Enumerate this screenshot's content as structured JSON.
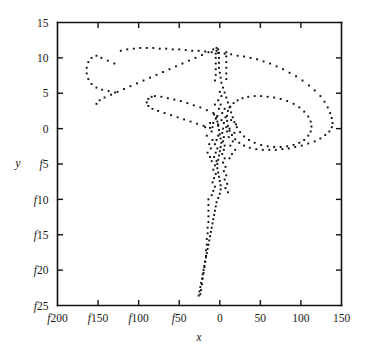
{
  "figure": {
    "background_color": "#ffffff",
    "ink_color": "#111111",
    "negative_sign_glyph": "f",
    "note": "Negative axis numbers are rendered with an italic 'f' in place of the minus sign (font encoding artifact)."
  },
  "chart_data": {
    "type": "scatter",
    "title": "",
    "subtitle": "",
    "xlabel": "x",
    "ylabel": "y",
    "legend": [],
    "legend_position": "none",
    "grid": false,
    "marker": "small filled square, dotted trajectory",
    "marker_color": "#0d0d0d",
    "xlim": [
      -200,
      150
    ],
    "ylim": [
      -25,
      15
    ],
    "xticks": [
      -200,
      -150,
      -100,
      -50,
      0,
      50,
      100,
      150
    ],
    "yticks": [
      15,
      10,
      5,
      0,
      -5,
      -10,
      -15,
      -20,
      -25
    ],
    "xtick_labels": [
      "f200",
      "f150",
      "f100",
      "f50",
      "0",
      "50",
      "100",
      "150"
    ],
    "ytick_labels": [
      "15",
      "10",
      "5",
      "0",
      "f5",
      "f10",
      "f15",
      "f20",
      "f25"
    ],
    "series": [
      {
        "name": "trajectory",
        "points": [
          [
            -122,
            11.0
          ],
          [
            -114,
            11.2
          ],
          [
            -106,
            11.3
          ],
          [
            -98,
            11.4
          ],
          [
            -90,
            11.4
          ],
          [
            -82,
            11.4
          ],
          [
            -74,
            11.3
          ],
          [
            -66,
            11.3
          ],
          [
            -58,
            11.2
          ],
          [
            -50,
            11.2
          ],
          [
            -42,
            11.1
          ],
          [
            -34,
            11.0
          ],
          [
            -26,
            11.0
          ],
          [
            -18,
            10.9
          ],
          [
            -10,
            10.8
          ],
          [
            -2,
            10.7
          ],
          [
            6,
            10.6
          ],
          [
            14,
            10.5
          ],
          [
            22,
            10.3
          ],
          [
            30,
            10.2
          ],
          [
            38,
            10.0
          ],
          [
            46,
            9.8
          ],
          [
            54,
            9.5
          ],
          [
            62,
            9.2
          ],
          [
            70,
            8.8
          ],
          [
            78,
            8.4
          ],
          [
            86,
            7.9
          ],
          [
            94,
            7.4
          ],
          [
            102,
            6.8
          ],
          [
            110,
            6.1
          ],
          [
            117,
            5.4
          ],
          [
            124,
            4.6
          ],
          [
            129,
            3.8
          ],
          [
            133,
            3.0
          ],
          [
            136,
            2.2
          ],
          [
            138,
            1.5
          ],
          [
            139,
            0.8
          ],
          [
            138,
            0.2
          ],
          [
            135,
            -0.4
          ],
          [
            130,
            -0.9
          ],
          [
            124,
            -1.4
          ],
          [
            117,
            -1.8
          ],
          [
            109,
            -2.1
          ],
          [
            101,
            -2.4
          ],
          [
            93,
            -2.6
          ],
          [
            85,
            -2.8
          ],
          [
            77,
            -2.9
          ],
          [
            69,
            -3.0
          ],
          [
            61,
            -3.0
          ],
          [
            53,
            -3.0
          ],
          [
            45,
            -2.9
          ],
          [
            37,
            -2.7
          ],
          [
            30,
            -2.4
          ],
          [
            24,
            -2.0
          ],
          [
            19,
            -1.5
          ],
          [
            15,
            -0.9
          ],
          [
            12,
            -0.3
          ],
          [
            10,
            0.4
          ],
          [
            9,
            1.1
          ],
          [
            9,
            1.8
          ],
          [
            10,
            2.5
          ],
          [
            13,
            3.1
          ],
          [
            17,
            3.6
          ],
          [
            22,
            4.0
          ],
          [
            28,
            4.3
          ],
          [
            35,
            4.5
          ],
          [
            43,
            4.6
          ],
          [
            51,
            4.6
          ],
          [
            59,
            4.5
          ],
          [
            67,
            4.4
          ],
          [
            75,
            4.2
          ],
          [
            83,
            3.9
          ],
          [
            91,
            3.5
          ],
          [
            98,
            3.0
          ],
          [
            104,
            2.4
          ],
          [
            109,
            1.7
          ],
          [
            112,
            1.0
          ],
          [
            113,
            0.3
          ],
          [
            112,
            -0.4
          ],
          [
            109,
            -1.0
          ],
          [
            104,
            -1.6
          ],
          [
            98,
            -2.0
          ],
          [
            91,
            -2.3
          ],
          [
            83,
            -2.5
          ],
          [
            75,
            -2.6
          ],
          [
            67,
            -2.6
          ],
          [
            59,
            -2.5
          ],
          [
            51,
            -2.3
          ],
          [
            43,
            -2.0
          ],
          [
            36,
            -1.6
          ],
          [
            30,
            -1.1
          ],
          [
            25,
            -0.5
          ],
          [
            21,
            0.2
          ],
          [
            18,
            0.9
          ],
          [
            16,
            1.6
          ],
          [
            14,
            2.3
          ],
          [
            12,
            3.0
          ],
          [
            10,
            3.7
          ],
          [
            8,
            4.4
          ],
          [
            6,
            5.1
          ],
          [
            4,
            5.8
          ],
          [
            2,
            6.5
          ],
          [
            1,
            7.2
          ],
          [
            0,
            7.9
          ],
          [
            -1,
            8.6
          ],
          [
            -1,
            9.3
          ],
          [
            -1,
            10.0
          ],
          [
            -1,
            10.7
          ],
          [
            -2,
            11.2
          ],
          [
            -4,
            11.4
          ],
          [
            -8,
            11.2
          ],
          [
            -14,
            10.8
          ],
          [
            -22,
            10.4
          ],
          [
            -30,
            10.0
          ],
          [
            -38,
            9.6
          ],
          [
            -46,
            9.2
          ],
          [
            -54,
            8.8
          ],
          [
            -62,
            8.4
          ],
          [
            -70,
            8.0
          ],
          [
            -78,
            7.6
          ],
          [
            -86,
            7.2
          ],
          [
            -94,
            6.8
          ],
          [
            -102,
            6.4
          ],
          [
            -110,
            6.0
          ],
          [
            -118,
            5.6
          ],
          [
            -126,
            5.2
          ],
          [
            -134,
            4.8
          ],
          [
            -142,
            4.4
          ],
          [
            -148,
            4.0
          ],
          [
            -152,
            3.5
          ],
          [
            -130,
            9.2
          ],
          [
            -138,
            9.6
          ],
          [
            -146,
            10.0
          ],
          [
            -152,
            10.3
          ],
          [
            -158,
            10.0
          ],
          [
            -162,
            9.4
          ],
          [
            -164,
            8.6
          ],
          [
            -164,
            7.8
          ],
          [
            -162,
            7.0
          ],
          [
            -158,
            6.3
          ],
          [
            -152,
            5.8
          ],
          [
            -145,
            5.5
          ],
          [
            -137,
            5.3
          ],
          [
            -129,
            5.1
          ],
          [
            -80,
            4.6
          ],
          [
            -72,
            4.5
          ],
          [
            -64,
            4.3
          ],
          [
            -56,
            4.1
          ],
          [
            -48,
            3.9
          ],
          [
            -40,
            3.6
          ],
          [
            -32,
            3.3
          ],
          [
            -24,
            3.0
          ],
          [
            -16,
            2.6
          ],
          [
            -8,
            2.2
          ],
          [
            -84,
            4.5
          ],
          [
            -88,
            4.2
          ],
          [
            -90,
            3.7
          ],
          [
            -88,
            3.2
          ],
          [
            -83,
            2.8
          ],
          [
            -76,
            2.5
          ],
          [
            -68,
            2.2
          ],
          [
            -60,
            1.9
          ],
          [
            -52,
            1.6
          ],
          [
            -44,
            1.3
          ],
          [
            -36,
            1.0
          ],
          [
            -28,
            0.7
          ],
          [
            -20,
            0.4
          ],
          [
            -12,
            0.1
          ],
          [
            -6,
            6.8
          ],
          [
            -5,
            7.6
          ],
          [
            -5,
            8.4
          ],
          [
            -5,
            9.2
          ],
          [
            -5,
            10.0
          ],
          [
            -5,
            10.6
          ],
          [
            -4,
            11.0
          ],
          [
            8,
            7.0
          ],
          [
            8,
            7.8
          ],
          [
            8,
            8.6
          ],
          [
            8,
            9.4
          ],
          [
            8,
            10.2
          ],
          [
            8,
            10.8
          ],
          [
            -4,
            1.6
          ],
          [
            -3,
            1.0
          ],
          [
            -2,
            0.4
          ],
          [
            -1,
            -0.2
          ],
          [
            0,
            -0.8
          ],
          [
            1,
            -1.4
          ],
          [
            2,
            -2.0
          ],
          [
            1,
            -2.6
          ],
          [
            0,
            -3.2
          ],
          [
            -1,
            -3.8
          ],
          [
            -2,
            -4.4
          ],
          [
            -3,
            -5.0
          ],
          [
            -3,
            -5.6
          ],
          [
            -2,
            -6.2
          ],
          [
            -1,
            -6.8
          ],
          [
            0,
            -7.4
          ],
          [
            1,
            -8.0
          ],
          [
            1,
            -8.6
          ],
          [
            0,
            -9.2
          ],
          [
            -2,
            -9.8
          ],
          [
            -4,
            -10.4
          ],
          [
            -5,
            -11.0
          ],
          [
            -6,
            -11.6
          ],
          [
            -7,
            -12.2
          ],
          [
            -8,
            -12.8
          ],
          [
            -9,
            -13.4
          ],
          [
            -10,
            -14.0
          ],
          [
            -11,
            -14.6
          ],
          [
            -12,
            -15.2
          ],
          [
            -13,
            -15.8
          ],
          [
            -14,
            -16.4
          ],
          [
            -15,
            -17.0
          ],
          [
            -16,
            -17.6
          ],
          [
            -17,
            -18.2
          ],
          [
            -18,
            -18.8
          ],
          [
            -19,
            -19.4
          ],
          [
            -20,
            -20.0
          ],
          [
            -21,
            -20.6
          ],
          [
            -22,
            -21.2
          ],
          [
            -23,
            -21.8
          ],
          [
            -24,
            -22.4
          ],
          [
            -25,
            -23.0
          ],
          [
            -26,
            -23.6
          ],
          [
            -14,
            -10.0
          ],
          [
            -14,
            -10.8
          ],
          [
            -14,
            -11.6
          ],
          [
            -14,
            -12.4
          ],
          [
            -14,
            -13.2
          ],
          [
            -15,
            -14.0
          ],
          [
            -15,
            -14.8
          ],
          [
            -16,
            -15.6
          ],
          [
            -16,
            -16.4
          ],
          [
            -17,
            -17.2
          ],
          [
            -17,
            -18.0
          ],
          [
            -18,
            -18.8
          ],
          [
            -19,
            -19.6
          ],
          [
            -20,
            -20.4
          ],
          [
            -21,
            -21.2
          ],
          [
            -22,
            -22.0
          ],
          [
            -23,
            -22.8
          ],
          [
            -24,
            -23.4
          ],
          [
            -2,
            -1.0
          ],
          [
            -4,
            -1.6
          ],
          [
            -6,
            -2.2
          ],
          [
            -3,
            -2.8
          ],
          [
            -5,
            -3.4
          ],
          [
            -7,
            -4.0
          ],
          [
            -4,
            -4.6
          ],
          [
            -6,
            -5.2
          ],
          [
            -8,
            -5.8
          ],
          [
            -5,
            -6.4
          ],
          [
            -7,
            -7.0
          ],
          [
            -9,
            -7.6
          ],
          [
            -6,
            -8.2
          ],
          [
            -8,
            -8.8
          ],
          [
            -10,
            -9.4
          ],
          [
            3,
            -0.6
          ],
          [
            5,
            -1.2
          ],
          [
            4,
            -1.8
          ],
          [
            6,
            -2.4
          ],
          [
            5,
            -3.0
          ],
          [
            3,
            -3.6
          ],
          [
            6,
            -4.2
          ],
          [
            4,
            -4.8
          ],
          [
            7,
            -5.4
          ],
          [
            5,
            -6.0
          ],
          [
            8,
            -6.6
          ],
          [
            6,
            -7.2
          ],
          [
            9,
            -7.8
          ],
          [
            7,
            -8.4
          ],
          [
            10,
            -9.0
          ],
          [
            -12,
            0.8
          ],
          [
            -18,
            0.2
          ],
          [
            -10,
            -0.4
          ],
          [
            -16,
            -1.0
          ],
          [
            -9,
            -1.6
          ],
          [
            -13,
            -2.2
          ],
          [
            -11,
            -2.8
          ],
          [
            -15,
            -3.4
          ],
          [
            -12,
            -4.0
          ],
          [
            -10,
            -4.6
          ],
          [
            14,
            1.2
          ],
          [
            20,
            0.6
          ],
          [
            12,
            0.0
          ],
          [
            18,
            -0.6
          ],
          [
            11,
            -1.2
          ],
          [
            16,
            -1.8
          ],
          [
            13,
            -2.4
          ],
          [
            19,
            -3.0
          ],
          [
            15,
            -3.6
          ],
          [
            12,
            -4.2
          ],
          [
            0,
            5.2
          ],
          [
            2,
            4.6
          ],
          [
            -2,
            4.0
          ],
          [
            1,
            3.4
          ],
          [
            -1,
            2.8
          ],
          [
            3,
            2.2
          ],
          [
            -3,
            1.8
          ],
          [
            2,
            1.2
          ],
          [
            -2,
            0.6
          ],
          [
            4,
            0.0
          ],
          [
            6,
            2.8
          ],
          [
            -6,
            3.4
          ],
          [
            7,
            1.6
          ],
          [
            -7,
            2.0
          ],
          [
            5,
            0.8
          ],
          [
            -5,
            1.4
          ],
          [
            8,
            0.2
          ],
          [
            -8,
            0.8
          ],
          [
            9,
            -0.4
          ],
          [
            -9,
            0.2
          ]
        ]
      }
    ]
  }
}
